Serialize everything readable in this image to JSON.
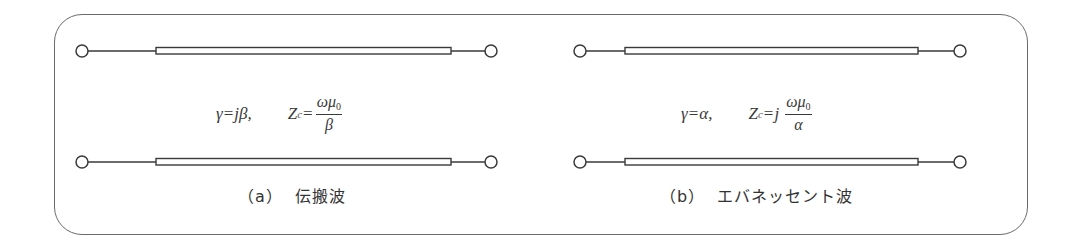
{
  "figure": {
    "panels": [
      {
        "id": "a",
        "formula": {
          "gamma_lhs": "γ",
          "gamma_eq": "=",
          "gamma_rhs": "jβ,",
          "z_lhs": "Z",
          "z_sub": "c",
          "z_eq": "=",
          "z_prefix": "",
          "frac_num": "ωμ",
          "frac_num_sub": "0",
          "frac_den": "β"
        },
        "caption_label": "（a）",
        "caption_text": "伝搬波"
      },
      {
        "id": "b",
        "formula": {
          "gamma_lhs": "γ",
          "gamma_eq": "=",
          "gamma_rhs": "α,",
          "z_lhs": "Z",
          "z_sub": "c",
          "z_eq": "=",
          "z_prefix": "j",
          "frac_num": "ωμ",
          "frac_num_sub": "0",
          "frac_den": "α"
        },
        "caption_label": "（b）",
        "caption_text": "エバネッセント波"
      }
    ],
    "colors": {
      "line": "#3a3a3a",
      "frame": "#6a6a6a",
      "background": "#ffffff"
    }
  }
}
